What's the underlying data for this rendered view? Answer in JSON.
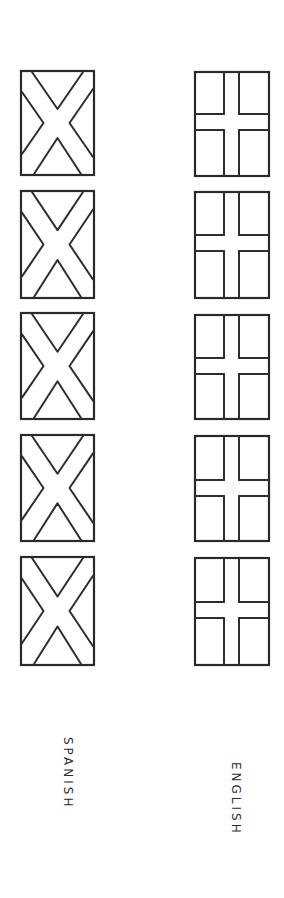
{
  "columns": [
    {
      "id": "spanish",
      "label": "SPANISH",
      "flag_type": "saltire",
      "count": 5
    },
    {
      "id": "english",
      "label": "ENGLISH",
      "flag_type": "cross",
      "count": 5
    }
  ],
  "colors": {
    "background": "#ffffff",
    "ink": "#2e2e2e"
  }
}
